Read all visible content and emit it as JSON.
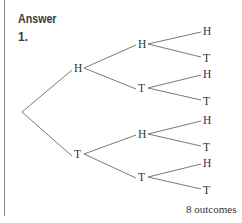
{
  "heading": "Answer",
  "question_number": "1.",
  "tree": {
    "root": {
      "x": 22,
      "y": 112
    },
    "level1": [
      {
        "label": "H",
        "x": 78,
        "y": 68
      },
      {
        "label": "T",
        "x": 78,
        "y": 154
      }
    ],
    "level2": [
      {
        "label": "H",
        "x": 142,
        "y": 44,
        "parent": 0
      },
      {
        "label": "T",
        "x": 142,
        "y": 88,
        "parent": 0
      },
      {
        "label": "H",
        "x": 142,
        "y": 134,
        "parent": 1
      },
      {
        "label": "T",
        "x": 142,
        "y": 177,
        "parent": 1
      }
    ],
    "level3": [
      {
        "label": "H",
        "x": 207,
        "y": 31,
        "parent": 0
      },
      {
        "label": "T",
        "x": 207,
        "y": 58,
        "parent": 0
      },
      {
        "label": "H",
        "x": 207,
        "y": 74,
        "parent": 1
      },
      {
        "label": "T",
        "x": 207,
        "y": 101,
        "parent": 1
      },
      {
        "label": "H",
        "x": 207,
        "y": 120,
        "parent": 2
      },
      {
        "label": "T",
        "x": 207,
        "y": 147,
        "parent": 2
      },
      {
        "label": "H",
        "x": 207,
        "y": 163,
        "parent": 3
      },
      {
        "label": "T",
        "x": 207,
        "y": 190,
        "parent": 3
      }
    ]
  },
  "outcomes_note": "8 outcomes"
}
